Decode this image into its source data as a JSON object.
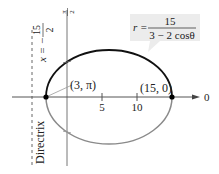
{
  "diagram": {
    "type": "polar-conic-ellipse",
    "equation": {
      "lhs": "r =",
      "numerator": "15",
      "denominator": "3 − 2 cosθ"
    },
    "directrix": {
      "label": "Directrix",
      "equation_lhs": "x = −",
      "equation_num": "15",
      "equation_den": "2"
    },
    "axis_labels": {
      "polar_axis": "0",
      "vertical_axis_num": "π",
      "vertical_axis_den": "2"
    },
    "ticks": [
      "5",
      "10"
    ],
    "points": [
      {
        "label": "(3, π)",
        "r": 3,
        "theta": "π"
      },
      {
        "label": "(15, 0)",
        "r": 15,
        "theta": "0"
      }
    ],
    "colors": {
      "upper_curve": "#111111",
      "lower_curve": "#8a8a8a",
      "axis": "#555555",
      "label_box": "#ececec"
    }
  }
}
